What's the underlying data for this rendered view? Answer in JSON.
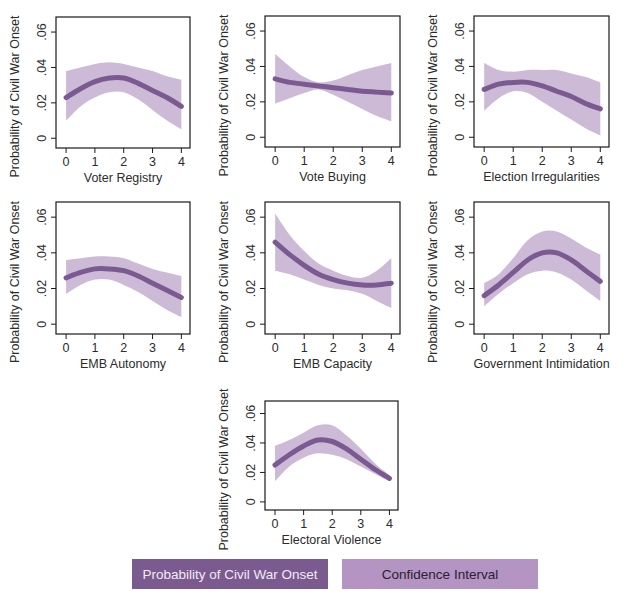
{
  "figure": {
    "colors": {
      "line": "#7a5a90",
      "band": "#c6b2d3",
      "frame": "#1a1a1a",
      "text": "#2b2b2b"
    },
    "legend": [
      {
        "label": "Probability of Civil War Onset",
        "color": "#7b5a8f"
      },
      {
        "label": "Confidence Interval",
        "color": "#b394c3"
      }
    ]
  },
  "chart_data": [
    {
      "type": "line",
      "title": "",
      "xlabel": "Voter Registry",
      "ylabel": "Probability of Civil War Onset",
      "x": [
        0,
        0.5,
        1,
        1.5,
        2,
        2.5,
        3,
        3.5,
        4
      ],
      "series": [
        {
          "name": "Probability of Civil War Onset",
          "values": [
            0.023,
            0.028,
            0.032,
            0.034,
            0.034,
            0.031,
            0.027,
            0.023,
            0.018
          ]
        },
        {
          "name": "Confidence Interval (lower)",
          "values": [
            0.01,
            0.018,
            0.023,
            0.026,
            0.026,
            0.022,
            0.016,
            0.01,
            0.005
          ]
        },
        {
          "name": "Confidence Interval (upper)",
          "values": [
            0.038,
            0.04,
            0.042,
            0.043,
            0.042,
            0.04,
            0.038,
            0.035,
            0.033
          ]
        }
      ],
      "xticks": [
        "0",
        "1",
        "2",
        "3",
        "4"
      ],
      "yticks": [
        "0",
        ".02",
        ".04",
        ".06"
      ],
      "xlim": [
        0,
        4
      ],
      "ylim": [
        0,
        0.06
      ],
      "grid": false
    },
    {
      "type": "line",
      "title": "",
      "xlabel": "Vote Buying",
      "ylabel": "Probability of Civil War Onset",
      "x": [
        0,
        0.5,
        1,
        1.5,
        2,
        2.5,
        3,
        3.5,
        4
      ],
      "series": [
        {
          "name": "Probability of Civil War Onset",
          "values": [
            0.033,
            0.031,
            0.03,
            0.029,
            0.028,
            0.027,
            0.026,
            0.0255,
            0.025
          ]
        },
        {
          "name": "Confidence Interval (lower)",
          "values": [
            0.019,
            0.022,
            0.025,
            0.027,
            0.024,
            0.02,
            0.016,
            0.012,
            0.009
          ]
        },
        {
          "name": "Confidence Interval (upper)",
          "values": [
            0.047,
            0.04,
            0.034,
            0.031,
            0.032,
            0.035,
            0.038,
            0.04,
            0.042
          ]
        }
      ],
      "xticks": [
        "0",
        "1",
        "2",
        "3",
        "4"
      ],
      "yticks": [
        "0",
        ".02",
        ".04",
        ".06"
      ],
      "xlim": [
        0,
        4
      ],
      "ylim": [
        0,
        0.06
      ],
      "grid": false
    },
    {
      "type": "line",
      "title": "",
      "xlabel": "Election Irregularities",
      "ylabel": "Probability of Civil War Onset",
      "x": [
        0,
        0.5,
        1,
        1.5,
        2,
        2.5,
        3,
        3.5,
        4
      ],
      "series": [
        {
          "name": "Probability of Civil War Onset",
          "values": [
            0.027,
            0.03,
            0.031,
            0.031,
            0.029,
            0.026,
            0.023,
            0.019,
            0.016
          ]
        },
        {
          "name": "Confidence Interval (lower)",
          "values": [
            0.015,
            0.022,
            0.026,
            0.025,
            0.02,
            0.015,
            0.01,
            0.005,
            0.001
          ]
        },
        {
          "name": "Confidence Interval (upper)",
          "values": [
            0.042,
            0.038,
            0.037,
            0.038,
            0.038,
            0.038,
            0.036,
            0.034,
            0.031
          ]
        }
      ],
      "xticks": [
        "0",
        "1",
        "2",
        "3",
        "4"
      ],
      "yticks": [
        "0",
        ".02",
        ".04",
        ".06"
      ],
      "xlim": [
        0,
        4
      ],
      "ylim": [
        0,
        0.06
      ],
      "grid": false
    },
    {
      "type": "line",
      "title": "",
      "xlabel": "EMB Autonomy",
      "ylabel": "Probability of Civil War Onset",
      "x": [
        0,
        0.5,
        1,
        1.5,
        2,
        2.5,
        3,
        3.5,
        4
      ],
      "series": [
        {
          "name": "Probability of Civil War Onset",
          "values": [
            0.026,
            0.029,
            0.031,
            0.031,
            0.03,
            0.027,
            0.023,
            0.019,
            0.015
          ]
        },
        {
          "name": "Confidence Interval (lower)",
          "values": [
            0.017,
            0.022,
            0.025,
            0.025,
            0.022,
            0.018,
            0.013,
            0.008,
            0.004
          ]
        },
        {
          "name": "Confidence Interval (upper)",
          "values": [
            0.036,
            0.037,
            0.038,
            0.038,
            0.037,
            0.034,
            0.031,
            0.029,
            0.027
          ]
        }
      ],
      "xticks": [
        "0",
        "1",
        "2",
        "3",
        "4"
      ],
      "yticks": [
        "0",
        ".02",
        ".04",
        ".06"
      ],
      "xlim": [
        0,
        4
      ],
      "ylim": [
        0,
        0.06
      ],
      "grid": false
    },
    {
      "type": "line",
      "title": "",
      "xlabel": "EMB Capacity",
      "ylabel": "Probability of Civil War Onset",
      "x": [
        0,
        0.5,
        1,
        1.5,
        2,
        2.5,
        3,
        3.5,
        4
      ],
      "series": [
        {
          "name": "Probability of Civil War Onset",
          "values": [
            0.046,
            0.039,
            0.033,
            0.028,
            0.025,
            0.023,
            0.022,
            0.022,
            0.023
          ]
        },
        {
          "name": "Confidence Interval (lower)",
          "values": [
            0.03,
            0.028,
            0.025,
            0.022,
            0.02,
            0.019,
            0.017,
            0.013,
            0.009
          ]
        },
        {
          "name": "Confidence Interval (upper)",
          "values": [
            0.062,
            0.05,
            0.041,
            0.034,
            0.03,
            0.027,
            0.026,
            0.03,
            0.037
          ]
        }
      ],
      "xticks": [
        "0",
        "1",
        "2",
        "3",
        "4"
      ],
      "yticks": [
        "0",
        ".02",
        ".04",
        ".06"
      ],
      "xlim": [
        0,
        4
      ],
      "ylim": [
        0,
        0.06
      ],
      "grid": false
    },
    {
      "type": "line",
      "title": "",
      "xlabel": "Government Intimidation",
      "ylabel": "Probability of Civil War Onset",
      "x": [
        0,
        0.5,
        1,
        1.5,
        2,
        2.5,
        3,
        3.5,
        4
      ],
      "series": [
        {
          "name": "Probability of Civil War Onset",
          "values": [
            0.016,
            0.022,
            0.029,
            0.036,
            0.04,
            0.04,
            0.036,
            0.03,
            0.024
          ]
        },
        {
          "name": "Confidence Interval (lower)",
          "values": [
            0.01,
            0.017,
            0.023,
            0.028,
            0.03,
            0.029,
            0.025,
            0.019,
            0.013
          ]
        },
        {
          "name": "Confidence Interval (upper)",
          "values": [
            0.023,
            0.028,
            0.037,
            0.047,
            0.052,
            0.052,
            0.048,
            0.043,
            0.039
          ]
        }
      ],
      "xticks": [
        "0",
        "1",
        "2",
        "3",
        "4"
      ],
      "yticks": [
        "0",
        ".02",
        ".04",
        ".06"
      ],
      "xlim": [
        0,
        4
      ],
      "ylim": [
        0,
        0.06
      ],
      "grid": false
    },
    {
      "type": "line",
      "title": "",
      "xlabel": "Electoral Violence",
      "ylabel": "Probability of Civil War Onset",
      "x": [
        0,
        0.5,
        1,
        1.5,
        2,
        2.5,
        3,
        3.5,
        4
      ],
      "series": [
        {
          "name": "Probability of Civil War Onset",
          "values": [
            0.025,
            0.032,
            0.038,
            0.042,
            0.041,
            0.036,
            0.029,
            0.022,
            0.016
          ]
        },
        {
          "name": "Confidence Interval (lower)",
          "values": [
            0.014,
            0.024,
            0.03,
            0.033,
            0.032,
            0.029,
            0.024,
            0.019,
            0.014
          ]
        },
        {
          "name": "Confidence Interval (upper)",
          "values": [
            0.038,
            0.042,
            0.047,
            0.052,
            0.052,
            0.045,
            0.036,
            0.026,
            0.018
          ]
        }
      ],
      "xticks": [
        "0",
        "1",
        "2",
        "3",
        "4"
      ],
      "yticks": [
        "0",
        ".02",
        ".04",
        ".06"
      ],
      "xlim": [
        0,
        4
      ],
      "ylim": [
        0,
        0.06
      ],
      "grid": false
    }
  ],
  "layout": {
    "panels": [
      {
        "left": 56,
        "top": 17,
        "width": 134,
        "height": 131
      },
      {
        "left": 265,
        "top": 16,
        "width": 135,
        "height": 131
      },
      {
        "left": 474,
        "top": 16,
        "width": 135,
        "height": 131
      },
      {
        "left": 56,
        "top": 202,
        "width": 134,
        "height": 132
      },
      {
        "left": 265,
        "top": 202,
        "width": 135,
        "height": 132
      },
      {
        "left": 474,
        "top": 202,
        "width": 135,
        "height": 132
      },
      {
        "left": 265,
        "top": 401,
        "width": 133,
        "height": 109
      }
    ]
  }
}
